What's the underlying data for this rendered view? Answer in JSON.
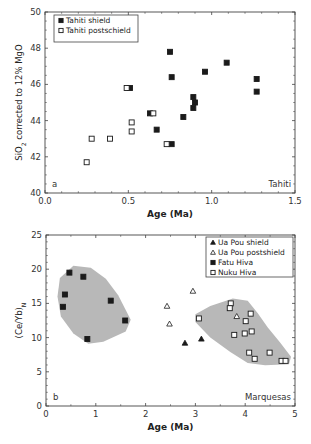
{
  "chart_data": [
    {
      "panel": "a",
      "type": "scatter",
      "title": "",
      "xlabel": "Age (Ma)",
      "ylabel": "SiO2 corrected to 12% MgO",
      "xlim": [
        0.0,
        1.5
      ],
      "ylim": [
        40,
        50
      ],
      "xticks": [
        "0.0",
        "0.5",
        "1.0",
        "1.5"
      ],
      "yticks": [
        "40",
        "42",
        "44",
        "46",
        "48",
        "50"
      ],
      "panel_label": "a",
      "annotation": "Tahiti",
      "legend_position": "top-left",
      "grid": false,
      "series": [
        {
          "name": "Tahiti shield",
          "marker": "filled-square",
          "points": [
            [
              0.75,
              47.8
            ],
            [
              0.76,
              46.4
            ],
            [
              0.51,
              45.8
            ],
            [
              0.96,
              46.7
            ],
            [
              1.09,
              47.2
            ],
            [
              1.27,
              46.3
            ],
            [
              1.27,
              45.6
            ],
            [
              0.89,
              45.3
            ],
            [
              0.9,
              45.0
            ],
            [
              0.89,
              44.7
            ],
            [
              0.63,
              44.4
            ],
            [
              0.83,
              44.2
            ],
            [
              0.67,
              43.5
            ],
            [
              0.76,
              42.7
            ]
          ]
        },
        {
          "name": "Tahiti postschield",
          "marker": "open-square",
          "points": [
            [
              0.49,
              45.8
            ],
            [
              0.65,
              44.4
            ],
            [
              0.52,
              43.9
            ],
            [
              0.52,
              43.4
            ],
            [
              0.28,
              43.0
            ],
            [
              0.39,
              43.0
            ],
            [
              0.73,
              42.7
            ],
            [
              0.25,
              41.7
            ]
          ]
        }
      ]
    },
    {
      "panel": "b",
      "type": "scatter",
      "title": "",
      "xlabel": "Age (Ma)",
      "ylabel": "(Ce/Yb)N",
      "xlim": [
        0,
        5
      ],
      "ylim": [
        0,
        25
      ],
      "xticks": [
        "0",
        "1",
        "2",
        "3",
        "4",
        "5"
      ],
      "yticks": [
        "0",
        "5",
        "10",
        "15",
        "20",
        "25"
      ],
      "panel_label": "b",
      "annotation": "Marquesas",
      "legend_position": "top-right",
      "grid": false,
      "shaded_regions": [
        "Fatu Hiva field",
        "Nuku Hiva field"
      ],
      "series": [
        {
          "name": "Ua Pou shield",
          "marker": "filled-triangle",
          "points": [
            [
              2.79,
              9.2
            ],
            [
              3.12,
              9.8
            ]
          ]
        },
        {
          "name": "Ua Pou postshield",
          "marker": "open-triangle",
          "points": [
            [
              2.95,
              16.8
            ],
            [
              2.43,
              14.6
            ],
            [
              2.48,
              12.0
            ],
            [
              3.83,
              13.1
            ]
          ]
        },
        {
          "name": "Fatu Hiva",
          "marker": "filled-square",
          "points": [
            [
              0.47,
              19.5
            ],
            [
              0.75,
              18.9
            ],
            [
              0.38,
              16.3
            ],
            [
              0.34,
              14.5
            ],
            [
              1.3,
              15.4
            ],
            [
              1.59,
              12.5
            ],
            [
              0.83,
              9.8
            ]
          ]
        },
        {
          "name": "Nuku Hiva",
          "marker": "open-square",
          "points": [
            [
              3.07,
              12.8
            ],
            [
              3.71,
              15.0
            ],
            [
              3.69,
              14.3
            ],
            [
              4.11,
              13.5
            ],
            [
              4.01,
              12.4
            ],
            [
              3.78,
              10.4
            ],
            [
              3.99,
              10.6
            ],
            [
              4.13,
              10.9
            ],
            [
              4.08,
              7.8
            ],
            [
              4.19,
              6.9
            ],
            [
              4.49,
              7.8
            ],
            [
              4.73,
              6.6
            ],
            [
              4.81,
              6.6
            ]
          ]
        }
      ]
    }
  ],
  "colors": {
    "marker_fill": "#1a1a1a",
    "marker_open_fill": "#ffffff",
    "shaded_field": "#b8b8b8",
    "axis": "#444444"
  }
}
